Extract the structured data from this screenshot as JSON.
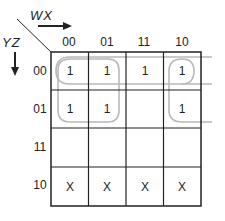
{
  "kmap": {
    "col_var": "WX",
    "row_var": "YZ",
    "col_labels": [
      "00",
      "01",
      "11",
      "10"
    ],
    "row_labels": [
      "00",
      "01",
      "11",
      "10"
    ],
    "cells": [
      [
        "1",
        "1",
        "1",
        "1"
      ],
      [
        "1",
        "1",
        "",
        "1"
      ],
      [
        "",
        "",
        "",
        ""
      ],
      [
        "X",
        "X",
        "X",
        "X"
      ]
    ],
    "groups": [
      {
        "name": "row-00-wrap",
        "description": "Row YZ=00, all four columns (wraps across right edge)"
      },
      {
        "name": "left-2x2",
        "description": "WX=00,01 x YZ=00,01"
      },
      {
        "name": "col-10-pair",
        "description": "WX=10, YZ=00,01 (wraps across right edge)"
      }
    ],
    "colors": {
      "grid": "#222222",
      "group_outline": "#b8b8b8",
      "text": "#222222"
    }
  }
}
